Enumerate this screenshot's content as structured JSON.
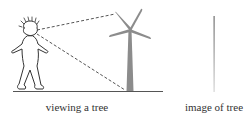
{
  "labels": {
    "left": "viewing a tree",
    "right": "image of tree"
  },
  "colors": {
    "outline": "#333333",
    "tree": "#8c8c8c",
    "ground": "#555555",
    "dashed": "#555555",
    "image_line_top": "#777777",
    "image_line_bottom": "#cfcfcf"
  }
}
